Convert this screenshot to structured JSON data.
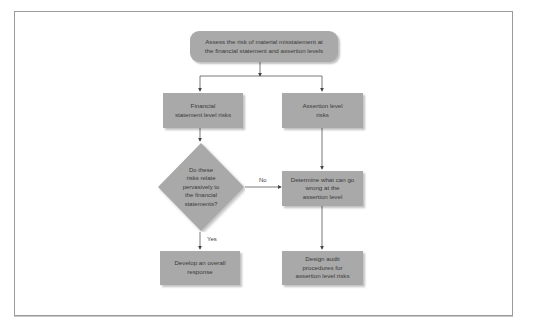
{
  "diagram": {
    "type": "flowchart",
    "nodes": {
      "assess": {
        "text": "Assess the risk of material misstatement at\nthe financial statement and assertion levels",
        "shape": "rounded-rect"
      },
      "fs_risks": {
        "text": "Financial\nstatement level risks",
        "shape": "rect"
      },
      "assertion_risks": {
        "text": "Assertion level\nrisks",
        "shape": "rect"
      },
      "decision": {
        "text": "Do these\nrisks relate\npervasively to\nthe financial\nstatements?",
        "shape": "diamond"
      },
      "determine": {
        "text": "Determine what can go\nwrong at the\nassertion level",
        "shape": "rect"
      },
      "overall": {
        "text": "Develop an overall\nresponse",
        "shape": "rect"
      },
      "design": {
        "text": "Design audit\nprocedures for\nassertion level risks",
        "shape": "rect"
      }
    },
    "edge_labels": {
      "no": "No",
      "yes": "Yes"
    },
    "edges": [
      {
        "from": "assess",
        "to": "fs_risks"
      },
      {
        "from": "assess",
        "to": "assertion_risks"
      },
      {
        "from": "fs_risks",
        "to": "decision"
      },
      {
        "from": "assertion_risks",
        "to": "determine"
      },
      {
        "from": "decision",
        "to": "determine",
        "label": "No"
      },
      {
        "from": "decision",
        "to": "overall",
        "label": "Yes"
      },
      {
        "from": "determine",
        "to": "design"
      }
    ],
    "colors": {
      "box_fill": "#a9a9a9",
      "line": "#555555",
      "frame": "#9a9a9a"
    }
  }
}
